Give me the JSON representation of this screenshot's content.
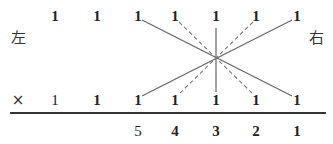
{
  "diagram": {
    "left_label": "左",
    "right_label": "右",
    "multiply_symbol": "×",
    "top_row": [
      "1",
      "1",
      "1",
      "1",
      "1",
      "1",
      "1"
    ],
    "bottom_row": [
      "1",
      "1",
      "1",
      "1",
      "1",
      "1",
      "1"
    ],
    "result_row": [
      "5",
      "4",
      "3",
      "2",
      "1"
    ],
    "line_color": "#666666",
    "lines": [
      {
        "type": "solid",
        "from": "top-3",
        "to": "bottom-7"
      },
      {
        "type": "solid",
        "from": "top-7",
        "to": "bottom-3"
      },
      {
        "type": "solid",
        "from": "top-5",
        "to": "bottom-5"
      },
      {
        "type": "dashed",
        "from": "top-4",
        "to": "bottom-6"
      },
      {
        "type": "dashed",
        "from": "top-6",
        "to": "bottom-4"
      }
    ]
  }
}
